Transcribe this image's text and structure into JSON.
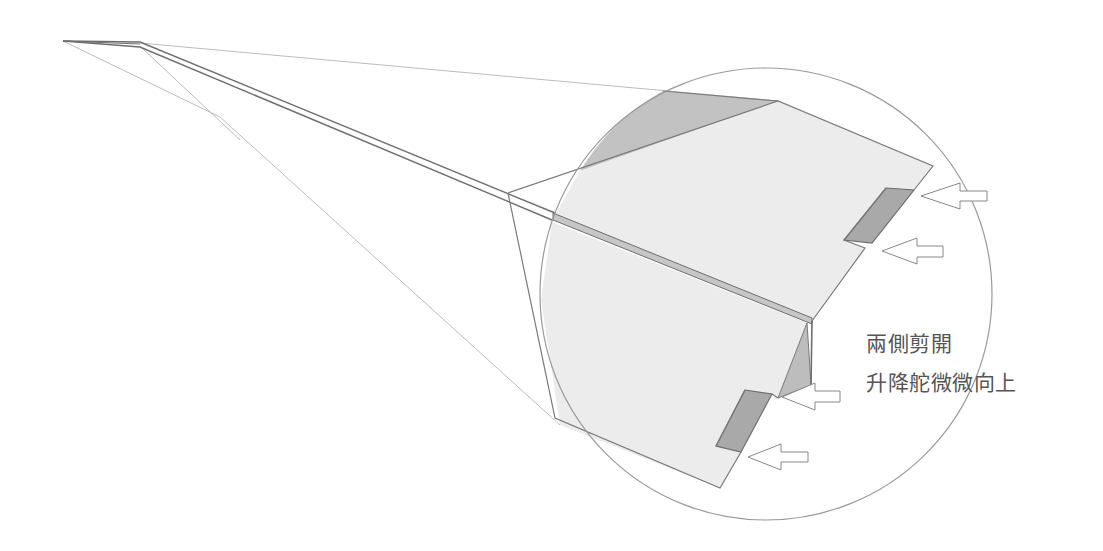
{
  "annotation": {
    "line1": "兩側剪開",
    "line2": "升降舵微微向上"
  },
  "colors": {
    "wing_fill": "#ececec",
    "fold_shadow": "#bdbdbd",
    "elevator_fill": "#a9a9a9",
    "outline": "#7a7a7a",
    "guide_line": "#bcbcbc",
    "circle_stroke": "#9a9a9a",
    "text": "#555555"
  },
  "zoom_circle": {
    "cx": 766,
    "cy": 294,
    "r": 226
  },
  "arrows": [
    {
      "name": "arrow-upper-elevator-top",
      "tip_x": 921,
      "tip_y": 196
    },
    {
      "name": "arrow-upper-elevator-bottom",
      "tip_x": 882,
      "tip_y": 251
    },
    {
      "name": "arrow-lower-elevator-top",
      "tip_x": 782,
      "tip_y": 397
    },
    {
      "name": "arrow-lower-elevator-bottom",
      "tip_x": 748,
      "tip_y": 457
    }
  ]
}
